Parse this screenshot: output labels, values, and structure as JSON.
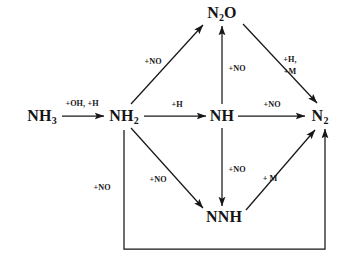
{
  "figure": {
    "kind": "reaction-pathway-diagram",
    "background_color": "#ffffff",
    "line_color": "#171717",
    "text_color": "#141414"
  },
  "nodes": [
    {
      "id": "nh3",
      "label_html": "NH<sub>3</sub>",
      "label_text": "NH3",
      "x": 42,
      "y": 116
    },
    {
      "id": "nh2",
      "label_html": "NH<sub>2</sub>",
      "label_text": "NH2",
      "x": 124,
      "y": 116
    },
    {
      "id": "nh",
      "label_html": "NH",
      "label_text": "NH",
      "x": 222,
      "y": 116
    },
    {
      "id": "n2o",
      "label_html": "N<sub>2</sub>O",
      "label_text": "N2O",
      "x": 222,
      "y": 13
    },
    {
      "id": "n2",
      "label_html": "N<sub>2</sub>",
      "label_text": "N2",
      "x": 320,
      "y": 116
    },
    {
      "id": "nnh",
      "label_html": "NNH",
      "label_text": "NNH",
      "x": 224,
      "y": 217
    }
  ],
  "edges": [
    {
      "id": "nh3-nh2",
      "from": "nh3",
      "to": "nh2",
      "label": "+OH, +H",
      "label_lines": [
        "+OH, +H"
      ],
      "label_x": 82,
      "label_y": 104
    },
    {
      "id": "nh2-n2o",
      "from": "nh2",
      "to": "n2o",
      "label": "+NO",
      "label_lines": [
        "+NO"
      ],
      "label_x": 153,
      "label_y": 62
    },
    {
      "id": "nh2-nh",
      "from": "nh2",
      "to": "nh",
      "label": "+H",
      "label_lines": [
        "+H"
      ],
      "label_x": 177,
      "label_y": 105
    },
    {
      "id": "nh-n2o",
      "from": "nh",
      "to": "n2o",
      "label": "+NO",
      "label_lines": [
        "+NO"
      ],
      "label_x": 237,
      "label_y": 69
    },
    {
      "id": "nh-n2",
      "from": "nh",
      "to": "n2",
      "label": "+NO",
      "label_lines": [
        "+NO"
      ],
      "label_x": 272,
      "label_y": 105
    },
    {
      "id": "n2o-n2",
      "from": "n2o",
      "to": "n2",
      "label": "+H, +M",
      "label_lines": [
        "+H,",
        "+M"
      ],
      "label_x": 290,
      "label_y": 66
    },
    {
      "id": "nh-nnh",
      "from": "nh",
      "to": "nnh",
      "label": "+NO",
      "label_lines": [
        "+NO"
      ],
      "label_x": 237,
      "label_y": 170
    },
    {
      "id": "nh2-nnh",
      "from": "nh2",
      "to": "nnh",
      "label": "+NO",
      "label_lines": [
        "+NO"
      ],
      "label_x": 158,
      "label_y": 180
    },
    {
      "id": "nnh-n2",
      "from": "nnh",
      "to": "n2",
      "label": "+ M",
      "label_lines": [
        "+ M"
      ],
      "label_x": 270,
      "label_y": 179
    },
    {
      "id": "nh2-n2-loop",
      "from": "nh2",
      "to": "n2",
      "label": "+NO",
      "label_lines": [
        "+NO"
      ],
      "label_x": 102,
      "label_y": 188
    }
  ]
}
